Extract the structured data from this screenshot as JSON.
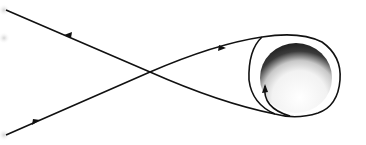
{
  "diagram": {
    "type": "free-return-trajectory",
    "body": {
      "name": "moon",
      "center": [
        300,
        80
      ],
      "radius": 36
    },
    "paths": [
      {
        "name": "outbound-path",
        "direction": "toward-moon",
        "arrows": 2
      },
      {
        "name": "return-path",
        "direction": "away-from-moon",
        "arrows": 1
      },
      {
        "name": "lunar-orbit-loop",
        "direction": "counter-clockwise",
        "arrows": 1
      }
    ],
    "colors": {
      "line": "#111111",
      "background": "#ffffff",
      "moon_dark": "#1a1a1a",
      "moon_light": "#f4f4f4",
      "fade_dot": "#d8d8d8"
    }
  }
}
